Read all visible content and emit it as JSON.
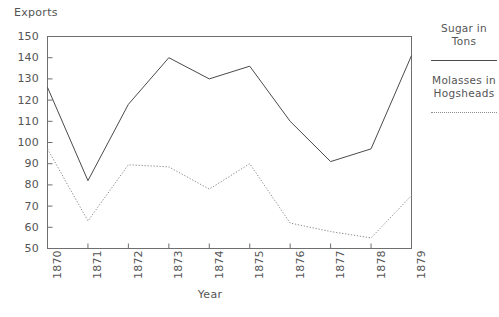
{
  "chart_data": {
    "type": "line",
    "title": "",
    "xlabel": "Year",
    "ylabel": "Exports",
    "categories": [
      "1870",
      "1871",
      "1872",
      "1873",
      "1874",
      "1875",
      "1876",
      "1877",
      "1878",
      "1879"
    ],
    "x": [
      1870,
      1871,
      1872,
      1873,
      1874,
      1875,
      1876,
      1877,
      1878,
      1879
    ],
    "xlim": [
      1870,
      1879
    ],
    "ylim": [
      50,
      150
    ],
    "yticks": [
      50,
      60,
      70,
      80,
      90,
      100,
      110,
      120,
      130,
      140,
      150
    ],
    "ytick_labels": [
      "50",
      "60",
      "70",
      "80",
      "90",
      "100",
      "110",
      "120",
      "130",
      "140",
      "150"
    ],
    "grid": false,
    "legend_position": "right",
    "series": [
      {
        "name": "Sugar in Tons",
        "style": "solid",
        "color": "#4a4a4a",
        "values": [
          126,
          82,
          118,
          140,
          130,
          136,
          110,
          91,
          97,
          141
        ]
      },
      {
        "name": "Molasses in Hogsheads",
        "style": "dotted",
        "color": "#8d8d8d",
        "values": [
          97,
          63,
          89.5,
          88.5,
          78,
          90,
          62,
          58,
          55,
          75
        ]
      }
    ]
  },
  "legend": {
    "entries": [
      {
        "label_line1": "Sugar in",
        "label_line2": "Tons",
        "style": "solid"
      },
      {
        "label_line1": "Molasses in",
        "label_line2": "Hogsheads",
        "style": "dotted"
      }
    ]
  },
  "axes": {
    "y_axis_title": "Exports",
    "x_axis_title": "Year"
  }
}
